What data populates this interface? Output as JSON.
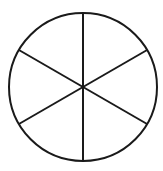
{
  "diagram": {
    "type": "circle-divided-into-sectors",
    "sectors": 6,
    "center": [
      83,
      87
    ],
    "radius": 74,
    "stroke_color": "#1a1a1a",
    "stroke_width": 2,
    "fill_color": "#ffffff",
    "divider_angles_deg": [
      90,
      30,
      -30
    ]
  }
}
